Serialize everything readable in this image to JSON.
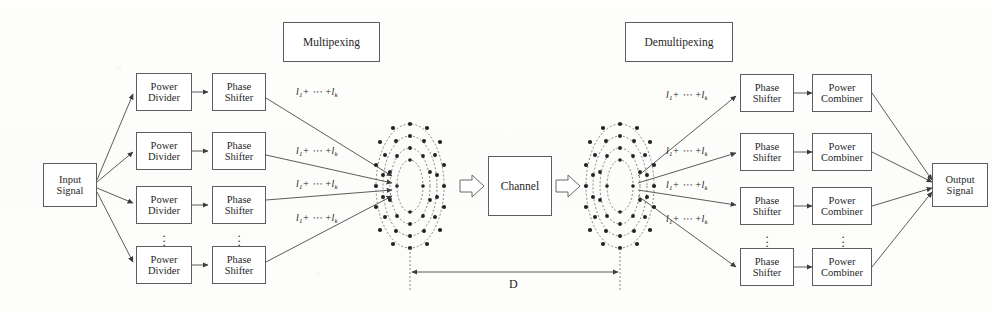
{
  "diagram": {
    "title_tx": "Multipexing",
    "title_rx": "Demultipexing",
    "channel_label": "Channel",
    "input_label_line1": "Input",
    "input_label_line2": "Signal",
    "output_label_line1": "Output",
    "output_label_line2": "Signal",
    "power_divider_line1": "Power",
    "power_divider_line2": "Divider",
    "phase_shifter_line1": "Phase",
    "phase_shifter_line2": "Shifter",
    "power_combiner_line1": "Power",
    "power_combiner_line2": "Combiner",
    "distance_label": "D",
    "ellipsis": "⋮",
    "mode_label_prefix": "l",
    "mode_label_sub1": "1",
    "mode_label_mid": "+ ⋯ +",
    "mode_label_sub2": "k",
    "tx_rows": [
      {
        "divider": "Power Divider",
        "shifter": "Phase Shifter",
        "mode": "l1+ ⋯ +lk"
      },
      {
        "divider": "Power Divider",
        "shifter": "Phase Shifter",
        "mode": "l1+ ⋯ +lk"
      },
      {
        "divider": "Power Divider",
        "shifter": "Phase Shifter",
        "mode": "l1+ ⋯ +lk"
      },
      {
        "divider": "Power Divider",
        "shifter": "Phase Shifter",
        "mode": "l1+ ⋯ +lk"
      }
    ],
    "rx_rows": [
      {
        "shifter": "Phase Shifter",
        "combiner": "Power Combiner",
        "mode": "l1+ ⋯ +lk"
      },
      {
        "shifter": "Phase Shifter",
        "combiner": "Power Combiner",
        "mode": "l1+ ⋯ +lk"
      },
      {
        "shifter": "Phase Shifter",
        "combiner": "Power Combiner",
        "mode": "l1+ ⋯ +lk"
      },
      {
        "shifter": "Phase Shifter",
        "combiner": "Power Combiner",
        "mode": "l1+ ⋯ +lk"
      }
    ],
    "colors": {
      "stroke": "#5d5d5d",
      "line": "#4a4a4a",
      "text": "#1f1f1f",
      "background": "#fdfdfc",
      "dot": "#232323"
    }
  }
}
